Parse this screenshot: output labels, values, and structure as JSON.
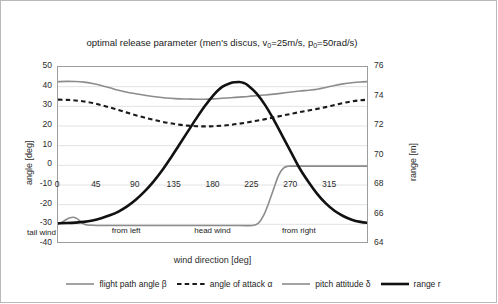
{
  "chart_data": {
    "type": "line",
    "title": "optimal release parameter  (men's discus,  v0=25m/s,  p0=50rad/s)",
    "title_parts": {
      "main": "optimal release parameter  (men's discus,  v",
      "sub1": "0",
      "mid": "=25m/s,  p",
      "sub2": "0",
      "end": "=50rad/s)"
    },
    "xlabel": "wind direction [deg]",
    "ylabel_left": "angle [deg]",
    "ylabel_right": "range [m]",
    "xlim": [
      0,
      360
    ],
    "ylim_left": [
      -40,
      50
    ],
    "ylim_right": [
      64,
      76
    ],
    "xticks": [
      0,
      45,
      90,
      135,
      180,
      225,
      270,
      315
    ],
    "yticks_left": [
      50,
      40,
      30,
      20,
      10,
      0,
      -10,
      -20,
      -30,
      -40
    ],
    "yticks_right": [
      76,
      74,
      72,
      70,
      68,
      66,
      64
    ],
    "grid": true,
    "legend_position": "bottom",
    "annotations": [
      {
        "text": "tail wind",
        "x": -18,
        "y": -35
      },
      {
        "text": "from left",
        "x": 80,
        "y": -34
      },
      {
        "text": "head wind",
        "x": 180,
        "y": -34
      },
      {
        "text": "from right",
        "x": 280,
        "y": -34
      }
    ],
    "series": [
      {
        "name": "flight path angle β",
        "axis": "left",
        "color": "#8c8c8c",
        "style": "solid",
        "width": 1.6,
        "x": [
          0,
          10,
          20,
          30,
          40,
          50,
          60,
          70,
          80,
          90,
          100,
          110,
          120,
          130,
          140,
          150,
          160,
          170,
          180,
          190,
          200,
          210,
          220,
          230,
          240,
          250,
          260,
          270,
          280,
          290,
          300,
          310,
          320,
          330,
          340,
          350,
          360
        ],
        "y": [
          42.5,
          42.7,
          42.6,
          42.3,
          41.6,
          40.6,
          39.4,
          38.2,
          37.2,
          36.4,
          35.6,
          35.0,
          34.5,
          34.1,
          33.8,
          33.7,
          33.6,
          33.6,
          33.8,
          34.1,
          34.4,
          34.7,
          35.0,
          35.4,
          35.8,
          36.2,
          36.7,
          37.3,
          37.8,
          38.2,
          38.7,
          39.6,
          40.6,
          41.4,
          42.0,
          42.4,
          42.6
        ]
      },
      {
        "name": "angle of attack α",
        "axis": "left",
        "color": "#1a1a1a",
        "style": "dashed",
        "width": 2.1,
        "x": [
          0,
          10,
          20,
          30,
          40,
          50,
          60,
          70,
          80,
          90,
          100,
          110,
          120,
          130,
          140,
          150,
          160,
          170,
          180,
          190,
          200,
          210,
          220,
          230,
          240,
          250,
          260,
          270,
          280,
          290,
          300,
          310,
          320,
          330,
          340,
          350,
          360
        ],
        "y": [
          33.4,
          33.3,
          33.0,
          32.5,
          31.7,
          30.6,
          29.4,
          28.1,
          26.8,
          25.5,
          24.3,
          23.2,
          22.2,
          21.4,
          20.7,
          20.2,
          19.9,
          19.8,
          19.9,
          20.2,
          20.6,
          21.2,
          21.9,
          22.7,
          23.5,
          24.4,
          25.3,
          26.2,
          27.1,
          27.9,
          28.7,
          29.6,
          30.7,
          31.7,
          32.5,
          33.1,
          33.4
        ]
      },
      {
        "name": "pitch attitude δ",
        "axis": "left",
        "color": "#8c8c8c",
        "style": "solid",
        "width": 1.6,
        "x": [
          0,
          5,
          10,
          14,
          18,
          22,
          26,
          30,
          34,
          40,
          50,
          70,
          100,
          140,
          180,
          210,
          225,
          232,
          238,
          244,
          250,
          254,
          258,
          262,
          266,
          270,
          280,
          300,
          320,
          340,
          360
        ],
        "y": [
          -29.8,
          -28.8,
          -27.4,
          -26.6,
          -26.4,
          -27.1,
          -28.6,
          -29.9,
          -30.3,
          -30.5,
          -30.6,
          -30.6,
          -30.6,
          -30.6,
          -30.6,
          -30.6,
          -30.6,
          -29.4,
          -25.5,
          -19.0,
          -11.5,
          -6.5,
          -3.0,
          -1.1,
          -0.5,
          -0.4,
          -0.4,
          -0.4,
          -0.4,
          -0.4,
          -0.4
        ]
      },
      {
        "name": "range r",
        "axis": "right",
        "color": "#111111",
        "style": "solid",
        "width": 2.6,
        "x": [
          0,
          10,
          20,
          30,
          40,
          50,
          60,
          70,
          80,
          90,
          100,
          110,
          120,
          130,
          140,
          150,
          160,
          170,
          180,
          190,
          200,
          205,
          210,
          215,
          220,
          230,
          240,
          250,
          260,
          270,
          280,
          290,
          300,
          310,
          320,
          330,
          340,
          350,
          360
        ],
        "y": [
          65.4,
          65.42,
          65.45,
          65.5,
          65.6,
          65.75,
          65.95,
          66.2,
          66.55,
          67.0,
          67.55,
          68.2,
          68.95,
          69.8,
          70.7,
          71.6,
          72.5,
          73.35,
          74.1,
          74.65,
          74.92,
          74.97,
          74.98,
          74.92,
          74.75,
          74.2,
          73.4,
          72.4,
          71.3,
          70.2,
          69.1,
          68.2,
          67.4,
          66.75,
          66.25,
          65.9,
          65.65,
          65.5,
          65.42
        ]
      }
    ]
  },
  "legend": [
    {
      "label": "flight path angle β",
      "color": "#8c8c8c",
      "style": "solid",
      "width": 1.6
    },
    {
      "label": "angle of attack α",
      "color": "#1a1a1a",
      "style": "dashed",
      "width": 2.1
    },
    {
      "label": "pitch attitude δ",
      "color": "#8c8c8c",
      "style": "solid",
      "width": 1.6
    },
    {
      "label": "range r",
      "color": "#111111",
      "style": "solid",
      "width": 2.6
    }
  ]
}
